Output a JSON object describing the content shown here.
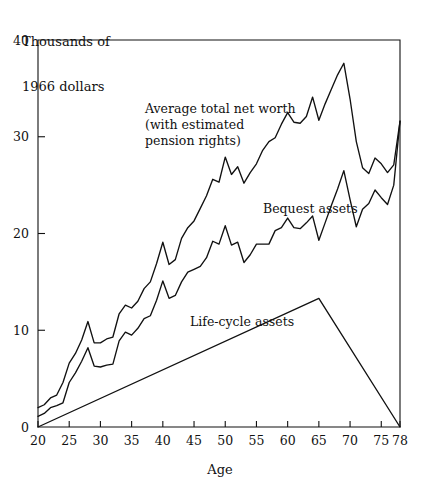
{
  "chart_data": {
    "type": "line",
    "title": "",
    "ylabel": "Thousands of\n1966 dollars",
    "ylabel_line1": "Thousands of",
    "ylabel_line2": "1966 dollars",
    "xlabel": "Age",
    "xlim": [
      20,
      78
    ],
    "ylim": [
      0,
      40
    ],
    "grid": false,
    "legend_position": "inline-annotations",
    "xticks": [
      20,
      25,
      30,
      35,
      40,
      45,
      50,
      55,
      60,
      65,
      70,
      75,
      78
    ],
    "xticklabels": [
      "20",
      "25",
      "30",
      "35",
      "40",
      "45",
      "50",
      "55",
      "60",
      "65",
      "70",
      "75",
      "78"
    ],
    "yticks": [
      0,
      10,
      20,
      30,
      40
    ],
    "yticklabels": [
      "0",
      "10",
      "20",
      "30",
      "40"
    ],
    "annotations": [
      {
        "name": "average-total-net-worth-label",
        "lines": [
          "Average total net worth",
          "(with estimated",
          "pension rights)"
        ],
        "x": 145,
        "y": 113
      },
      {
        "name": "bequest-assets-label",
        "lines": [
          "Bequest assets"
        ],
        "x": 263,
        "y": 213
      },
      {
        "name": "life-cycle-assets-label",
        "lines": [
          "Life-cycle assets"
        ],
        "x": 190,
        "y": 326
      }
    ],
    "series": [
      {
        "name": "Average total net worth (with estimated pension rights)",
        "x": [
          20,
          21,
          22,
          23,
          24,
          25,
          26,
          27,
          28,
          29,
          30,
          31,
          32,
          33,
          34,
          35,
          36,
          37,
          38,
          39,
          40,
          41,
          42,
          43,
          44,
          45,
          46,
          47,
          48,
          49,
          50,
          51,
          52,
          53,
          54,
          55,
          56,
          57,
          58,
          59,
          60,
          61,
          62,
          63,
          64,
          65,
          66,
          67,
          68,
          69,
          70,
          71,
          72,
          73,
          74,
          75,
          76,
          77,
          78
        ],
        "values": [
          2.0,
          2.3,
          3.0,
          3.3,
          4.6,
          6.6,
          7.6,
          9.0,
          10.9,
          8.7,
          8.7,
          9.1,
          9.3,
          11.7,
          12.6,
          12.3,
          13.0,
          14.3,
          15.0,
          16.9,
          19.1,
          16.8,
          17.3,
          19.5,
          20.6,
          21.3,
          22.6,
          23.9,
          25.6,
          25.3,
          27.9,
          26.1,
          26.9,
          25.2,
          26.3,
          27.2,
          28.6,
          29.5,
          29.9,
          31.3,
          32.5,
          31.5,
          31.4,
          32.1,
          34.1,
          31.7,
          33.4,
          34.9,
          36.4,
          37.6,
          33.9,
          29.5,
          26.8,
          26.2,
          27.8,
          27.2,
          26.3,
          27.1,
          31.6
        ]
      },
      {
        "name": "Bequest assets",
        "x": [
          20,
          21,
          22,
          23,
          24,
          25,
          26,
          27,
          28,
          29,
          30,
          31,
          32,
          33,
          34,
          35,
          36,
          37,
          38,
          39,
          40,
          41,
          42,
          43,
          44,
          45,
          46,
          47,
          48,
          49,
          50,
          51,
          52,
          53,
          54,
          55,
          56,
          57,
          58,
          59,
          60,
          61,
          62,
          63,
          64,
          65,
          66,
          67,
          68,
          69,
          70,
          71,
          72,
          73,
          74,
          75,
          76,
          77,
          78
        ],
        "values": [
          1.1,
          1.4,
          2.0,
          2.2,
          2.5,
          4.6,
          5.6,
          6.8,
          8.2,
          6.3,
          6.2,
          6.4,
          6.5,
          8.9,
          9.8,
          9.5,
          10.2,
          11.2,
          11.5,
          13.1,
          15.1,
          13.3,
          13.6,
          15.0,
          16.0,
          16.3,
          16.6,
          17.5,
          19.2,
          18.9,
          20.8,
          18.8,
          19.1,
          17.0,
          17.8,
          18.9,
          18.9,
          18.9,
          20.3,
          20.6,
          21.6,
          20.6,
          20.5,
          21.1,
          21.8,
          19.3,
          21.1,
          22.9,
          24.6,
          26.5,
          23.5,
          20.7,
          22.5,
          23.1,
          24.5,
          23.7,
          23.0,
          25.0,
          31.6
        ]
      },
      {
        "name": "Life-cycle assets",
        "x": [
          20,
          65,
          78
        ],
        "values": [
          0.0,
          13.3,
          0.0
        ]
      }
    ]
  }
}
